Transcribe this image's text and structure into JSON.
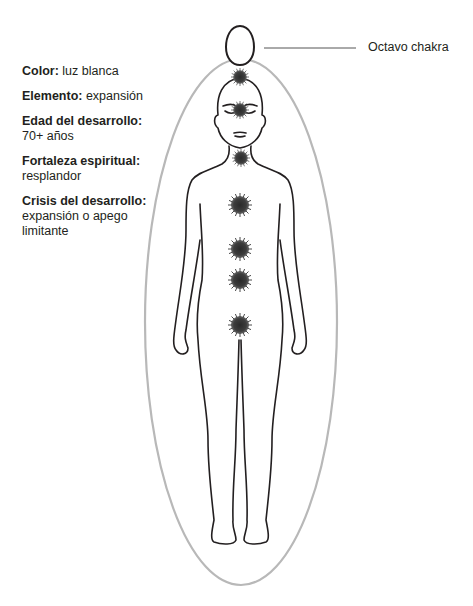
{
  "info": {
    "entries": [
      {
        "key": "Color:",
        "value": "luz blanca",
        "inline": true
      },
      {
        "key": "Elemento:",
        "value": "expansión",
        "inline": true
      },
      {
        "key": "Edad del desarrollo:",
        "value": "70+ años",
        "inline": false
      },
      {
        "key": "Fortaleza espiritual:",
        "value": "resplandor",
        "inline": false
      },
      {
        "key": "Crisis del desarrollo:",
        "value": "expansión o apego limitante",
        "inline": false
      }
    ]
  },
  "diagram": {
    "eighth_chakra_label": "Octavo chakra",
    "colors": {
      "outline": "#231f20",
      "aura": "#b5b5b5",
      "chakra": "#3a3a3a",
      "leader_line": "#555555"
    },
    "chakras": [
      {
        "name": "crown",
        "y": 77
      },
      {
        "name": "third-eye",
        "y": 110
      },
      {
        "name": "throat",
        "y": 158
      },
      {
        "name": "heart",
        "y": 205
      },
      {
        "name": "solar-plexus",
        "y": 249
      },
      {
        "name": "sacral",
        "y": 280
      },
      {
        "name": "root",
        "y": 325
      }
    ]
  }
}
